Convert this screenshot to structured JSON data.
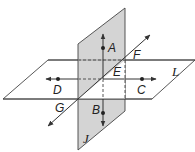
{
  "diagram": {
    "colors": {
      "plane_J_fill": "#d4d4d4",
      "plane_L_fill": "#ffffff",
      "stroke": "#333333",
      "background": "#ffffff"
    },
    "planes": {
      "J": {
        "label": "J",
        "type": "vertical",
        "shaded": true
      },
      "L": {
        "label": "L",
        "type": "horizontal",
        "shaded": false
      }
    },
    "points": {
      "A": {
        "label": "A"
      },
      "B": {
        "label": "B"
      },
      "C": {
        "label": "C"
      },
      "D": {
        "label": "D"
      },
      "E": {
        "label": "E"
      },
      "F": {
        "label": "F"
      },
      "G": {
        "label": "G"
      }
    },
    "lines": [
      {
        "name": "line-AB",
        "through": [
          "A",
          "B"
        ],
        "arrows": "both"
      },
      {
        "name": "line-DC",
        "through": [
          "D",
          "C"
        ],
        "arrows": "both"
      },
      {
        "name": "line-GF",
        "through": [
          "G",
          "F"
        ],
        "arrows": "both"
      }
    ]
  }
}
